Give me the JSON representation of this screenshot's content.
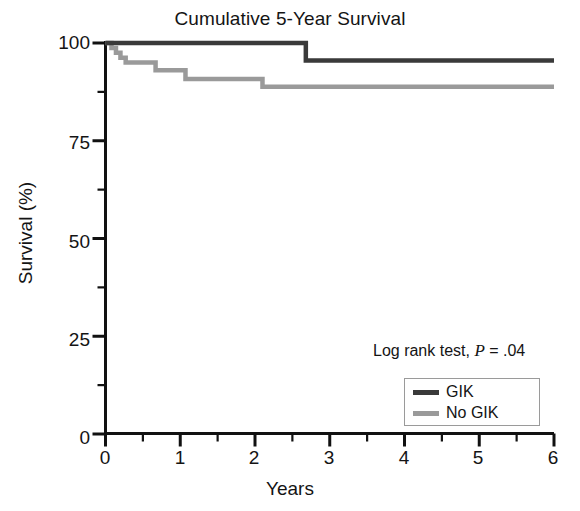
{
  "chart_data": {
    "type": "line",
    "title": "Cumulative 5-Year Survival",
    "xlabel": "Years",
    "ylabel": "Survival (%)",
    "xlim": [
      0,
      6
    ],
    "ylim": [
      0,
      100
    ],
    "xticks": [
      "0",
      "1",
      "2",
      "3",
      "4",
      "5",
      "6"
    ],
    "yticks": [
      "0",
      "25",
      "50",
      "75",
      "100"
    ],
    "x_minor_tick_interval": 0.5,
    "y_minor_tick_interval": 12.5,
    "grid": false,
    "legend_position": "lower right",
    "annotation": "Log rank test, P = .04",
    "annotation_prefix": "Log rank test, ",
    "annotation_italic": "P",
    "annotation_suffix": " = .04",
    "series": [
      {
        "name": "GIK",
        "color": "#3a3a3a",
        "step": "post",
        "x": [
          0,
          0.12,
          0.2,
          2.68,
          6.0
        ],
        "y": [
          100,
          100,
          100,
          100,
          95.5
        ],
        "points": [
          {
            "x": 0.0,
            "y": 100
          },
          {
            "x": 2.68,
            "y": 100
          },
          {
            "x": 2.68,
            "y": 95.5
          },
          {
            "x": 6.0,
            "y": 95.5
          }
        ]
      },
      {
        "name": "No GIK",
        "color": "#9a9a9a",
        "step": "post",
        "points": [
          {
            "x": 0.0,
            "y": 100.0
          },
          {
            "x": 0.08,
            "y": 100.0
          },
          {
            "x": 0.08,
            "y": 98.7
          },
          {
            "x": 0.14,
            "y": 98.7
          },
          {
            "x": 0.14,
            "y": 97.5
          },
          {
            "x": 0.2,
            "y": 97.5
          },
          {
            "x": 0.2,
            "y": 96.2
          },
          {
            "x": 0.27,
            "y": 96.2
          },
          {
            "x": 0.27,
            "y": 95.0
          },
          {
            "x": 0.67,
            "y": 95.0
          },
          {
            "x": 0.67,
            "y": 93.0
          },
          {
            "x": 1.07,
            "y": 93.0
          },
          {
            "x": 1.07,
            "y": 90.8
          },
          {
            "x": 2.1,
            "y": 90.8
          },
          {
            "x": 2.1,
            "y": 88.8
          },
          {
            "x": 6.0,
            "y": 88.8
          }
        ]
      }
    ]
  },
  "axes": {
    "title": "Cumulative 5-Year Survival",
    "ylabel": "Survival (%)",
    "xlabel": "Years",
    "ytick_labels": [
      "100",
      "75",
      "50",
      "25",
      "0"
    ],
    "xtick_labels": [
      "0",
      "1",
      "2",
      "3",
      "4",
      "5",
      "6"
    ]
  },
  "legend": {
    "entries": [
      {
        "label": "GIK",
        "color": "#3a3a3a"
      },
      {
        "label": "No GIK",
        "color": "#9a9a9a"
      }
    ]
  },
  "colors": {
    "gik": "#3a3a3a",
    "no_gik": "#9a9a9a",
    "axis": "#111111",
    "background": "#ffffff"
  }
}
